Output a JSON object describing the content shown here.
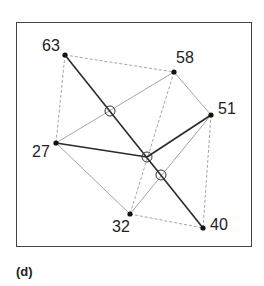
{
  "caption": "(d)",
  "nodes": [
    {
      "id": "63",
      "label": "63",
      "x": 65,
      "y": 55,
      "lx": 42,
      "ly": 38
    },
    {
      "id": "58",
      "label": "58",
      "x": 174,
      "y": 72,
      "lx": 176,
      "ly": 50
    },
    {
      "id": "51",
      "label": "51",
      "x": 211,
      "y": 115,
      "lx": 218,
      "ly": 100
    },
    {
      "id": "27",
      "label": "27",
      "x": 56,
      "y": 143,
      "lx": 32,
      "ly": 144
    },
    {
      "id": "32",
      "label": "32",
      "x": 130,
      "y": 214,
      "lx": 112,
      "ly": 220
    },
    {
      "id": "40",
      "label": "40",
      "x": 203,
      "y": 228,
      "lx": 210,
      "ly": 217
    }
  ],
  "edges_bold": [
    [
      "63",
      "40"
    ],
    [
      "27",
      "C"
    ],
    [
      "C",
      "51"
    ]
  ],
  "edges_light": [
    [
      "63",
      "58"
    ],
    [
      "63",
      "27"
    ],
    [
      "58",
      "51"
    ],
    [
      "58",
      "32"
    ],
    [
      "27",
      "58"
    ],
    [
      "27",
      "32"
    ],
    [
      "32",
      "40"
    ],
    [
      "51",
      "40"
    ],
    [
      "51",
      "32"
    ]
  ],
  "intersections": [
    {
      "x": 110,
      "y": 111
    },
    {
      "x": 147,
      "y": 157
    },
    {
      "x": 161,
      "y": 175
    }
  ],
  "colors": {
    "bold": "#2a2a2a",
    "light": "#9a9a9a",
    "frame": "#444444"
  }
}
